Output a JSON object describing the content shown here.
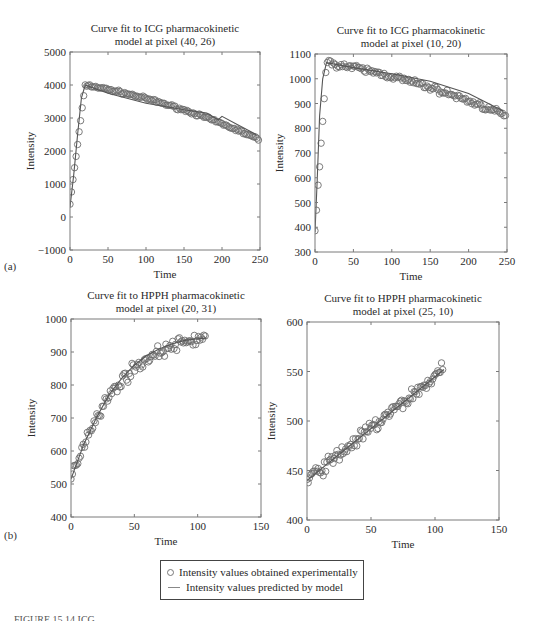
{
  "figure": {
    "panel_labels": [
      "(a)",
      "(b)"
    ],
    "caption_fragment": "FIGURE 15.14   ICG ..."
  },
  "legend": {
    "items": [
      {
        "marker": "circle",
        "label": "Intensity values obtained experimentally"
      },
      {
        "marker": "line",
        "label": "Intensity values predicted by model"
      }
    ]
  },
  "colors": {
    "marker": "#6e6e6e",
    "fit_line": "#555555",
    "axis": "#7a7a7a",
    "text": "#2a2a2a"
  },
  "chart_data": [
    {
      "id": "a1",
      "type": "scatter",
      "title": "Curve fit to ICG pharmacokinetic\nmodel at pixel (40, 26)",
      "title_lines": [
        "Curve fit to ICG pharmacokinetic",
        "model at pixel (40, 26)"
      ],
      "xlabel": "Time",
      "ylabel": "Intensity",
      "xlim": [
        0,
        250
      ],
      "ylim": [
        -1000,
        5000
      ],
      "xticks": [
        0,
        50,
        100,
        150,
        200,
        250
      ],
      "yticks": [
        -1000,
        0,
        1000,
        2000,
        3000,
        4000,
        5000
      ],
      "grid": false,
      "box": {
        "left": 70,
        "top": 52,
        "right": 260,
        "bottom": 250
      },
      "series": [
        {
          "name": "Intensity values obtained experimentally",
          "style": "markers",
          "profile": "icg",
          "peak_x": 20,
          "peak_y": 4000,
          "start_y": 400,
          "end_y": 2350,
          "noise": 60,
          "n": 125
        },
        {
          "name": "Intensity values predicted by model",
          "style": "line",
          "x": [
            0,
            5,
            10,
            15,
            20,
            50,
            100,
            150,
            180,
            195,
            200,
            220,
            245
          ],
          "y": [
            300,
            1300,
            2500,
            3600,
            4000,
            3750,
            3450,
            3250,
            3150,
            2950,
            3050,
            2800,
            2500
          ]
        }
      ]
    },
    {
      "id": "a2",
      "type": "scatter",
      "title_lines": [
        "Curve fit to ICG pharmacokinetic",
        "model at pixel (10, 20)"
      ],
      "xlabel": "Time",
      "ylabel": "Intensity",
      "xlim": [
        0,
        250
      ],
      "ylim": [
        300,
        1100
      ],
      "xticks": [
        0,
        50,
        100,
        150,
        200,
        250
      ],
      "yticks": [
        300,
        400,
        500,
        600,
        700,
        800,
        900,
        1000,
        1100
      ],
      "grid": false,
      "box": {
        "left": 315,
        "top": 54,
        "right": 507,
        "bottom": 252
      },
      "series": [
        {
          "name": "Intensity values obtained experimentally",
          "style": "markers",
          "profile": "icg",
          "peak_x": 15,
          "peak_y": 1065,
          "start_y": 380,
          "end_y": 850,
          "noise": 18,
          "n": 125
        },
        {
          "name": "Intensity values predicted by model",
          "style": "line",
          "x": [
            0,
            3,
            6,
            10,
            15,
            50,
            100,
            150,
            200,
            245
          ],
          "y": [
            380,
            600,
            850,
            1000,
            1065,
            1045,
            1020,
            990,
            940,
            870
          ]
        }
      ]
    },
    {
      "id": "b1",
      "type": "scatter",
      "title_lines": [
        "Curve fit to HPPH pharmacokinetic",
        "model at pixel (20, 31)"
      ],
      "xlabel": "Time",
      "ylabel": "Intensity",
      "xlim": [
        0,
        150
      ],
      "ylim": [
        400,
        1000
      ],
      "xticks": [
        0,
        50,
        100,
        150
      ],
      "yticks": [
        400,
        500,
        600,
        700,
        800,
        900,
        1000
      ],
      "grid": false,
      "box": {
        "left": 71,
        "top": 319,
        "right": 261,
        "bottom": 517
      },
      "series": [
        {
          "name": "Intensity values obtained experimentally",
          "style": "markers",
          "profile": "hpph_sat",
          "start_y": 515,
          "end_y": 945,
          "noise": 28,
          "n": 100,
          "x_end": 107
        },
        {
          "name": "Intensity values predicted by model",
          "style": "line",
          "x": [
            0,
            10,
            20,
            30,
            40,
            50,
            60,
            70,
            80,
            90,
            100,
            107
          ],
          "y": [
            515,
            620,
            700,
            770,
            820,
            860,
            890,
            910,
            925,
            935,
            940,
            942
          ]
        }
      ]
    },
    {
      "id": "b2",
      "type": "scatter",
      "title_lines": [
        "Curve fit to HPPH pharmacokinetic",
        "model at pixel (25, 10)"
      ],
      "xlabel": "Time",
      "ylabel": "Intensity",
      "xlim": [
        0,
        150
      ],
      "ylim": [
        400,
        600
      ],
      "xticks": [
        0,
        50,
        100,
        150
      ],
      "yticks": [
        400,
        450,
        500,
        550,
        600
      ],
      "grid": false,
      "box": {
        "left": 307,
        "top": 322,
        "right": 499,
        "bottom": 520
      },
      "series": [
        {
          "name": "Intensity values obtained experimentally",
          "style": "markers",
          "profile": "linear",
          "start_y": 440,
          "end_y": 552,
          "noise": 11,
          "n": 110,
          "x_end": 107
        },
        {
          "name": "Intensity values predicted by model",
          "style": "line",
          "x": [
            0,
            107
          ],
          "y": [
            440,
            552
          ]
        }
      ]
    }
  ]
}
